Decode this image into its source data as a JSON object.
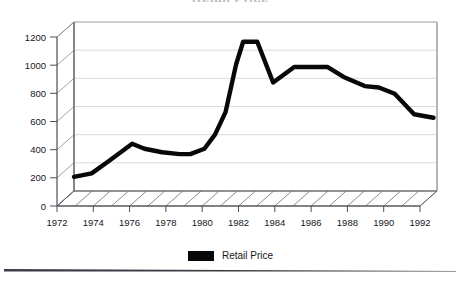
{
  "chart_data": {
    "type": "line",
    "title": "Retail Price",
    "subtitle": "",
    "xlabel": "",
    "ylabel": "",
    "xlim": [
      1972,
      1992.6
    ],
    "ylim": [
      0,
      1200
    ],
    "grid": true,
    "legend_position": "bottom-center",
    "style": "3d-perspective-scanned",
    "x_tick_labels": [
      "1972",
      "1974",
      "1976",
      "1978",
      "1980",
      "1982",
      "1984",
      "1986",
      "1988",
      "1990",
      "1992"
    ],
    "x_ticks": [
      1972,
      1974,
      1976,
      1978,
      1980,
      1982,
      1984,
      1986,
      1988,
      1990,
      1992
    ],
    "y_tick_labels": [
      "0",
      "200",
      "400",
      "600",
      "800",
      "1000",
      "1200"
    ],
    "y_ticks": [
      0,
      200,
      400,
      600,
      800,
      1000,
      1200
    ],
    "series": [
      {
        "name": "Retail Price",
        "color": "#080808",
        "x": [
          1972,
          1973,
          1974,
          1975.3,
          1976,
          1977,
          1978,
          1978.6,
          1979.4,
          1980,
          1980.6,
          1981.2,
          1981.6,
          1982.4,
          1983.3,
          1984.5,
          1986.4,
          1987.3,
          1988.5,
          1989.3,
          1990.2,
          1991.3,
          1992.4
        ],
        "values": [
          100,
          125,
          215,
          335,
          300,
          275,
          262,
          262,
          300,
          400,
          560,
          900,
          1060,
          1060,
          770,
          880,
          880,
          810,
          745,
          735,
          690,
          545,
          520
        ]
      }
    ],
    "legend": [
      {
        "label": "Retail Price",
        "color": "#080808"
      }
    ]
  },
  "colors": {
    "series": "#080808",
    "grid": "#c9c9cf",
    "frame": "#4a4a52",
    "text": "#16161a",
    "background": "#ffffff"
  }
}
